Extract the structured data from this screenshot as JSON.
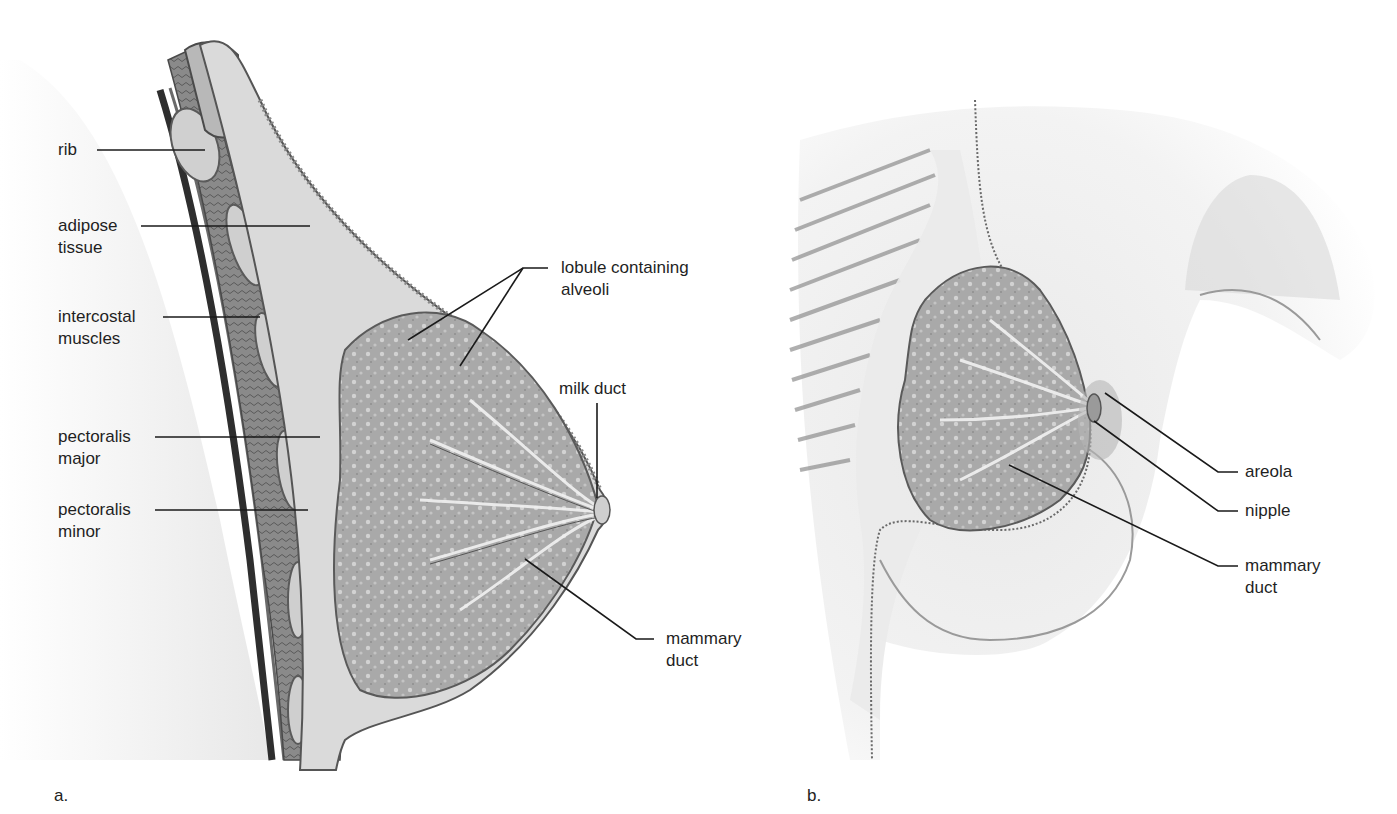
{
  "figure": {
    "panels": [
      {
        "id": "a",
        "letter": "a.",
        "view": "sagittal-section"
      },
      {
        "id": "b",
        "letter": "b.",
        "view": "anterior-cutaway"
      }
    ]
  },
  "panel_a": {
    "letter": "a.",
    "labels": {
      "rib": "rib",
      "adipose_tissue": "adipose\ntissue",
      "intercostal_muscles": "intercostal\nmuscles",
      "pectoralis_major": "pectoralis\nmajor",
      "pectoralis_minor": "pectoralis\nminor",
      "lobule_containing_alveoli": "lobule containing\nalveoli",
      "milk_duct": "milk duct",
      "mammary_duct": "mammary\nduct"
    }
  },
  "panel_b": {
    "letter": "b.",
    "labels": {
      "areola": "areola",
      "nipple": "nipple",
      "mammary_duct": "mammary\nduct"
    }
  },
  "colors": {
    "background": "#ffffff",
    "leader_line": "#1a1a1a",
    "label_text": "#1f1f1f",
    "skin_tone": "#e6e6e6",
    "adipose": "#d9d9d9",
    "gland": "#a8a8a8",
    "muscle": "#8c8c8c",
    "chest_wall_dark": "#3a3a3a"
  }
}
